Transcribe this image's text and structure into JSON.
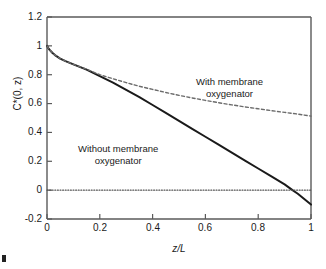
{
  "chart_data": {
    "type": "line",
    "title": "",
    "xlabel": "z/L",
    "ylabel": "C*(0, z)",
    "xlim": [
      0,
      1
    ],
    "ylim": [
      -0.2,
      1.2
    ],
    "xticks": [
      "0",
      "0.2",
      "0.4",
      "0.6",
      "0.8",
      "1"
    ],
    "xtick_values": [
      0,
      0.2,
      0.4,
      0.6,
      0.8,
      1
    ],
    "yticks": [
      "1.2",
      "1",
      "0.8",
      "0.6",
      "0.4",
      "0.2",
      "0",
      "-0.2"
    ],
    "ytick_values": [
      1.2,
      1,
      0.8,
      0.6,
      0.4,
      0.2,
      0,
      -0.2
    ],
    "grid": false,
    "legend": "annotations",
    "series": [
      {
        "name": "Without membrane oxygenator",
        "style": "solid",
        "color": "#1a1a1a",
        "x": [
          0.0,
          0.005,
          0.01,
          0.02,
          0.03,
          0.05,
          0.07,
          0.1,
          0.15,
          0.2,
          0.25,
          0.3,
          0.35,
          0.4,
          0.45,
          0.5,
          0.55,
          0.6,
          0.65,
          0.7,
          0.75,
          0.8,
          0.85,
          0.9,
          0.93,
          0.95,
          1.0
        ],
        "y": [
          1.0,
          0.985,
          0.972,
          0.952,
          0.936,
          0.912,
          0.894,
          0.872,
          0.835,
          0.79,
          0.745,
          0.695,
          0.645,
          0.59,
          0.535,
          0.48,
          0.425,
          0.37,
          0.315,
          0.26,
          0.205,
          0.15,
          0.095,
          0.04,
          0.0,
          -0.025,
          -0.1
        ]
      },
      {
        "name": "With membrane oxygenator",
        "style": "dashed",
        "color": "#6b6b6b",
        "x": [
          0.0,
          0.005,
          0.01,
          0.02,
          0.03,
          0.05,
          0.07,
          0.1,
          0.15,
          0.2,
          0.25,
          0.3,
          0.35,
          0.4,
          0.45,
          0.5,
          0.55,
          0.6,
          0.65,
          0.7,
          0.75,
          0.8,
          0.85,
          0.9,
          0.95,
          1.0
        ],
        "y": [
          1.0,
          0.985,
          0.972,
          0.952,
          0.936,
          0.912,
          0.894,
          0.872,
          0.838,
          0.8,
          0.772,
          0.745,
          0.72,
          0.698,
          0.677,
          0.657,
          0.639,
          0.622,
          0.606,
          0.591,
          0.577,
          0.564,
          0.551,
          0.539,
          0.527,
          0.513
        ]
      },
      {
        "name": "Zero reference line",
        "style": "dotted",
        "color": "#555555",
        "x": [
          0.0,
          1.0
        ],
        "y": [
          0.0,
          0.0
        ]
      }
    ],
    "annotations": [
      {
        "text_line1": "With membrane",
        "text_line2": "oxygenator",
        "x": 0.62,
        "y": 0.68
      },
      {
        "text_line1": "Without membrane",
        "text_line2": "oxygenator",
        "x": 0.3,
        "y": 0.28
      }
    ]
  },
  "figure": {
    "caption_mark": ""
  }
}
